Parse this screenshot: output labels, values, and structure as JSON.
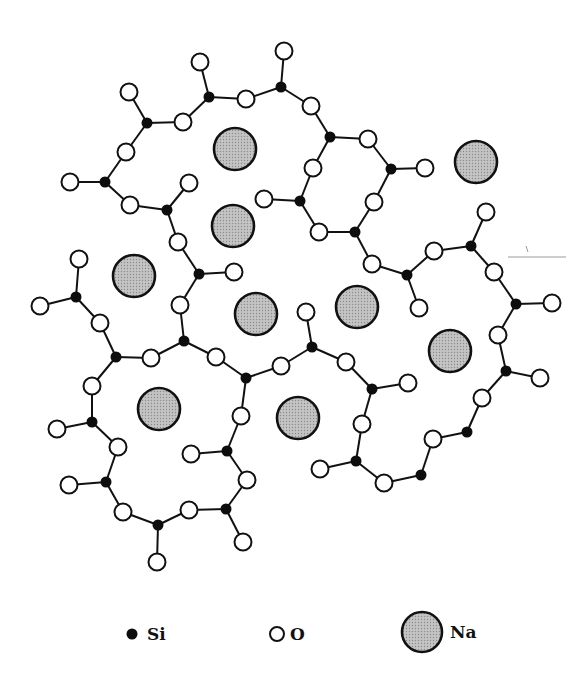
{
  "figure": {
    "colors": {
      "si_fill": "#0d0d0d",
      "o_fill": "#ffffff",
      "na_fill": "#b9b9b9",
      "stroke": "#111111",
      "background": "#ffffff"
    },
    "radii": {
      "si": 5.5,
      "o": 8.5,
      "na": 21
    },
    "si_atoms": [
      [
        147,
        123
      ],
      [
        209,
        97
      ],
      [
        281,
        87
      ],
      [
        105,
        182
      ],
      [
        167,
        210
      ],
      [
        330,
        137
      ],
      [
        391,
        169
      ],
      [
        300,
        201
      ],
      [
        355,
        232
      ],
      [
        407,
        275
      ],
      [
        471,
        246
      ],
      [
        516,
        304
      ],
      [
        506,
        371
      ],
      [
        467,
        432
      ],
      [
        421,
        475
      ],
      [
        356,
        461
      ],
      [
        372,
        389
      ],
      [
        312,
        347
      ],
      [
        246,
        378
      ],
      [
        184,
        341
      ],
      [
        199,
        274
      ],
      [
        76,
        297
      ],
      [
        116,
        357
      ],
      [
        92,
        422
      ],
      [
        106,
        482
      ],
      [
        158,
        525
      ],
      [
        226,
        509
      ],
      [
        227,
        451
      ]
    ],
    "o_atoms": [
      [
        129,
        92
      ],
      [
        183,
        122
      ],
      [
        200,
        62
      ],
      [
        246,
        99
      ],
      [
        284,
        51
      ],
      [
        126,
        152
      ],
      [
        70,
        182
      ],
      [
        130,
        205
      ],
      [
        189,
        183
      ],
      [
        178,
        242
      ],
      [
        311,
        106
      ],
      [
        368,
        139
      ],
      [
        425,
        168
      ],
      [
        313,
        168
      ],
      [
        374,
        202
      ],
      [
        264,
        199
      ],
      [
        319,
        232
      ],
      [
        372,
        264
      ],
      [
        419,
        308
      ],
      [
        434,
        251
      ],
      [
        486,
        212
      ],
      [
        494,
        272
      ],
      [
        552,
        303
      ],
      [
        498,
        335
      ],
      [
        540,
        378
      ],
      [
        482,
        398
      ],
      [
        433,
        439
      ],
      [
        384,
        483
      ],
      [
        320,
        469
      ],
      [
        362,
        424
      ],
      [
        408,
        383
      ],
      [
        346,
        362
      ],
      [
        306,
        312
      ],
      [
        281,
        366
      ],
      [
        216,
        357
      ],
      [
        241,
        416
      ],
      [
        180,
        305
      ],
      [
        234,
        272
      ],
      [
        79,
        259
      ],
      [
        40,
        306
      ],
      [
        100,
        323
      ],
      [
        151,
        358
      ],
      [
        92,
        386
      ],
      [
        57,
        429
      ],
      [
        118,
        447
      ],
      [
        69,
        485
      ],
      [
        123,
        512
      ],
      [
        157,
        562
      ],
      [
        189,
        510
      ],
      [
        243,
        542
      ],
      [
        247,
        480
      ],
      [
        191,
        454
      ]
    ],
    "na_atoms": [
      [
        235,
        149
      ],
      [
        233,
        226
      ],
      [
        476,
        162
      ],
      [
        134,
        276
      ],
      [
        256,
        314
      ],
      [
        357,
        307
      ],
      [
        450,
        351
      ],
      [
        159,
        409
      ],
      [
        298,
        418
      ]
    ],
    "bonds": [
      [
        [
          147,
          123
        ],
        [
          129,
          92
        ]
      ],
      [
        [
          147,
          123
        ],
        [
          183,
          122
        ]
      ],
      [
        [
          147,
          123
        ],
        [
          126,
          152
        ]
      ],
      [
        [
          209,
          97
        ],
        [
          183,
          122
        ]
      ],
      [
        [
          209,
          97
        ],
        [
          200,
          62
        ]
      ],
      [
        [
          209,
          97
        ],
        [
          246,
          99
        ]
      ],
      [
        [
          281,
          87
        ],
        [
          246,
          99
        ]
      ],
      [
        [
          281,
          87
        ],
        [
          284,
          51
        ]
      ],
      [
        [
          281,
          87
        ],
        [
          311,
          106
        ]
      ],
      [
        [
          105,
          182
        ],
        [
          126,
          152
        ]
      ],
      [
        [
          105,
          182
        ],
        [
          70,
          182
        ]
      ],
      [
        [
          105,
          182
        ],
        [
          130,
          205
        ]
      ],
      [
        [
          167,
          210
        ],
        [
          130,
          205
        ]
      ],
      [
        [
          167,
          210
        ],
        [
          189,
          183
        ]
      ],
      [
        [
          167,
          210
        ],
        [
          178,
          242
        ]
      ],
      [
        [
          330,
          137
        ],
        [
          311,
          106
        ]
      ],
      [
        [
          330,
          137
        ],
        [
          368,
          139
        ]
      ],
      [
        [
          330,
          137
        ],
        [
          313,
          168
        ]
      ],
      [
        [
          391,
          169
        ],
        [
          368,
          139
        ]
      ],
      [
        [
          391,
          169
        ],
        [
          425,
          168
        ]
      ],
      [
        [
          391,
          169
        ],
        [
          374,
          202
        ]
      ],
      [
        [
          300,
          201
        ],
        [
          313,
          168
        ]
      ],
      [
        [
          300,
          201
        ],
        [
          264,
          199
        ]
      ],
      [
        [
          300,
          201
        ],
        [
          319,
          232
        ]
      ],
      [
        [
          355,
          232
        ],
        [
          319,
          232
        ]
      ],
      [
        [
          355,
          232
        ],
        [
          374,
          202
        ]
      ],
      [
        [
          355,
          232
        ],
        [
          372,
          264
        ]
      ],
      [
        [
          407,
          275
        ],
        [
          372,
          264
        ]
      ],
      [
        [
          407,
          275
        ],
        [
          434,
          251
        ]
      ],
      [
        [
          407,
          275
        ],
        [
          419,
          308
        ]
      ],
      [
        [
          471,
          246
        ],
        [
          434,
          251
        ]
      ],
      [
        [
          471,
          246
        ],
        [
          486,
          212
        ]
      ],
      [
        [
          471,
          246
        ],
        [
          494,
          272
        ]
      ],
      [
        [
          516,
          304
        ],
        [
          494,
          272
        ]
      ],
      [
        [
          516,
          304
        ],
        [
          552,
          303
        ]
      ],
      [
        [
          516,
          304
        ],
        [
          498,
          335
        ]
      ],
      [
        [
          506,
          371
        ],
        [
          498,
          335
        ]
      ],
      [
        [
          506,
          371
        ],
        [
          540,
          378
        ]
      ],
      [
        [
          506,
          371
        ],
        [
          482,
          398
        ]
      ],
      [
        [
          467,
          432
        ],
        [
          482,
          398
        ]
      ],
      [
        [
          467,
          432
        ],
        [
          433,
          439
        ]
      ],
      [
        [
          421,
          475
        ],
        [
          433,
          439
        ]
      ],
      [
        [
          421,
          475
        ],
        [
          384,
          483
        ]
      ],
      [
        [
          356,
          461
        ],
        [
          384,
          483
        ]
      ],
      [
        [
          356,
          461
        ],
        [
          320,
          469
        ]
      ],
      [
        [
          356,
          461
        ],
        [
          362,
          424
        ]
      ],
      [
        [
          372,
          389
        ],
        [
          362,
          424
        ]
      ],
      [
        [
          372,
          389
        ],
        [
          408,
          383
        ]
      ],
      [
        [
          372,
          389
        ],
        [
          346,
          362
        ]
      ],
      [
        [
          312,
          347
        ],
        [
          346,
          362
        ]
      ],
      [
        [
          312,
          347
        ],
        [
          306,
          312
        ]
      ],
      [
        [
          312,
          347
        ],
        [
          281,
          366
        ]
      ],
      [
        [
          246,
          378
        ],
        [
          281,
          366
        ]
      ],
      [
        [
          246,
          378
        ],
        [
          216,
          357
        ]
      ],
      [
        [
          246,
          378
        ],
        [
          241,
          416
        ]
      ],
      [
        [
          184,
          341
        ],
        [
          216,
          357
        ]
      ],
      [
        [
          184,
          341
        ],
        [
          151,
          358
        ]
      ],
      [
        [
          184,
          341
        ],
        [
          180,
          305
        ]
      ],
      [
        [
          199,
          274
        ],
        [
          180,
          305
        ]
      ],
      [
        [
          199,
          274
        ],
        [
          234,
          272
        ]
      ],
      [
        [
          199,
          274
        ],
        [
          178,
          242
        ]
      ],
      [
        [
          76,
          297
        ],
        [
          79,
          259
        ]
      ],
      [
        [
          76,
          297
        ],
        [
          40,
          306
        ]
      ],
      [
        [
          76,
          297
        ],
        [
          100,
          323
        ]
      ],
      [
        [
          116,
          357
        ],
        [
          100,
          323
        ]
      ],
      [
        [
          116,
          357
        ],
        [
          151,
          358
        ]
      ],
      [
        [
          116,
          357
        ],
        [
          92,
          386
        ]
      ],
      [
        [
          92,
          422
        ],
        [
          92,
          386
        ]
      ],
      [
        [
          92,
          422
        ],
        [
          57,
          429
        ]
      ],
      [
        [
          92,
          422
        ],
        [
          118,
          447
        ]
      ],
      [
        [
          106,
          482
        ],
        [
          118,
          447
        ]
      ],
      [
        [
          106,
          482
        ],
        [
          69,
          485
        ]
      ],
      [
        [
          106,
          482
        ],
        [
          123,
          512
        ]
      ],
      [
        [
          158,
          525
        ],
        [
          123,
          512
        ]
      ],
      [
        [
          158,
          525
        ],
        [
          157,
          562
        ]
      ],
      [
        [
          158,
          525
        ],
        [
          189,
          510
        ]
      ],
      [
        [
          226,
          509
        ],
        [
          189,
          510
        ]
      ],
      [
        [
          226,
          509
        ],
        [
          243,
          542
        ]
      ],
      [
        [
          226,
          509
        ],
        [
          247,
          480
        ]
      ],
      [
        [
          227,
          451
        ],
        [
          247,
          480
        ]
      ],
      [
        [
          227,
          451
        ],
        [
          191,
          454
        ]
      ],
      [
        [
          227,
          451
        ],
        [
          241,
          416
        ]
      ]
    ],
    "hairline": {
      "x1": 508,
      "y1": 257,
      "x2": 566,
      "y2": 257,
      "tick": [
        [
          526,
          246
        ],
        [
          528,
          252
        ]
      ]
    }
  },
  "legend": {
    "items": [
      {
        "symbol": "si",
        "label": "Si",
        "cx": 132,
        "cy": 634,
        "r": 5.5,
        "tx": 147,
        "ty": 640
      },
      {
        "symbol": "o",
        "label": "O",
        "cx": 277,
        "cy": 634,
        "r": 7,
        "tx": 290,
        "ty": 640
      },
      {
        "symbol": "na",
        "label": "Na",
        "cx": 422,
        "cy": 632,
        "r": 20,
        "tx": 450,
        "ty": 638
      }
    ]
  }
}
